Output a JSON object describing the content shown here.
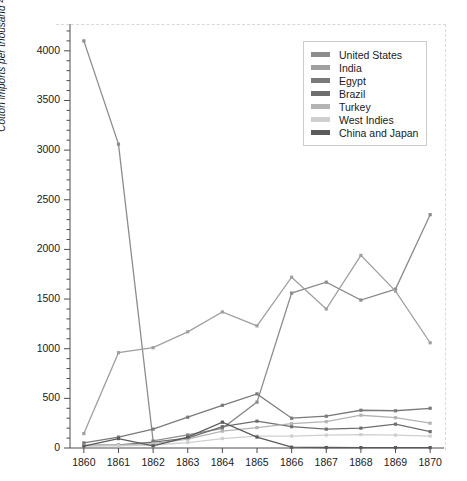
{
  "chart_data": {
    "type": "line",
    "title": "",
    "xlabel": "",
    "ylabel": "Cotton imports per thousand 400-pound bales",
    "x": [
      1860,
      1861,
      1862,
      1863,
      1864,
      1865,
      1866,
      1867,
      1868,
      1869,
      1870
    ],
    "xtick_labels": [
      "1860",
      "1861",
      "1862",
      "1863",
      "1864",
      "1865",
      "1866",
      "1867",
      "1868",
      "1869",
      "1870"
    ],
    "ytick_labels": [
      "0",
      "500",
      "1000",
      "1500",
      "2000",
      "2500",
      "3000",
      "3500",
      "4000"
    ],
    "ytick_values": [
      0,
      500,
      1000,
      1500,
      2000,
      2500,
      3000,
      3500,
      4000
    ],
    "xlim": [
      1859.6,
      1870.4
    ],
    "ylim": [
      0,
      4250
    ],
    "grid": false,
    "legend_position": "upper right",
    "series": [
      {
        "name": "United States",
        "color": "#8c8c8c",
        "values": [
          4100,
          3060,
          72,
          132,
          198,
          462,
          1560,
          1670,
          1490,
          1600,
          2350
        ]
      },
      {
        "name": "India",
        "color": "#a0a0a0",
        "values": [
          145,
          960,
          1010,
          1170,
          1370,
          1230,
          1720,
          1400,
          1940,
          1580,
          1060
        ]
      },
      {
        "name": "Egypt",
        "color": "#7a7a7a",
        "values": [
          52,
          110,
          190,
          310,
          430,
          545,
          300,
          320,
          380,
          375,
          400
        ]
      },
      {
        "name": "Brazil",
        "color": "#6e6e6e",
        "values": [
          26,
          30,
          60,
          100,
          215,
          270,
          215,
          190,
          200,
          240,
          165
        ]
      },
      {
        "name": "Turkey",
        "color": "#b4b4b4",
        "values": [
          22,
          28,
          45,
          90,
          170,
          205,
          245,
          265,
          330,
          305,
          250
        ]
      },
      {
        "name": "West Indies",
        "color": "#cfcfcf",
        "values": [
          20,
          22,
          30,
          55,
          95,
          120,
          120,
          130,
          135,
          130,
          120
        ]
      },
      {
        "name": "China and Japan",
        "color": "#5a5a5a",
        "values": [
          18,
          95,
          22,
          110,
          260,
          110,
          8,
          5,
          4,
          4,
          4
        ]
      }
    ]
  },
  "legend": {
    "entries": [
      {
        "label": "United States"
      },
      {
        "label": "India"
      },
      {
        "label": "Egypt"
      },
      {
        "label": "Brazil"
      },
      {
        "label": "Turkey"
      },
      {
        "label": "West Indies"
      },
      {
        "label": "China and Japan"
      }
    ]
  }
}
